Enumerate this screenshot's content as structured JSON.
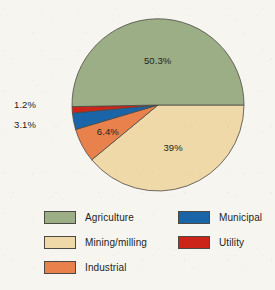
{
  "chart_data": {
    "type": "pie",
    "title": "",
    "legend_position": "bottom",
    "categories": [
      "Agriculture",
      "Mining/milling",
      "Industrial",
      "Municipal",
      "Utility"
    ],
    "values": [
      50.3,
      39,
      6.4,
      3.1,
      1.2
    ],
    "value_labels": [
      "50.3%",
      "39%",
      "6.4%",
      "3.1%",
      "1.2%"
    ],
    "colors": [
      "#9cae85",
      "#efd9a8",
      "#e8814c",
      "#1a65a8",
      "#cc2418"
    ],
    "units": "percent",
    "slices": [
      {
        "name": "Agriculture",
        "value": 50.3,
        "label": "50.3%",
        "color": "#9cae85",
        "label_placement": "inside"
      },
      {
        "name": "Mining/milling",
        "value": 39,
        "label": "39%",
        "color": "#efd9a8",
        "label_placement": "inside"
      },
      {
        "name": "Industrial",
        "value": 6.4,
        "label": "6.4%",
        "color": "#e8814c",
        "label_placement": "inside"
      },
      {
        "name": "Municipal",
        "value": 3.1,
        "label": "3.1%",
        "color": "#1a65a8",
        "label_placement": "outside-left"
      },
      {
        "name": "Utility",
        "value": 1.2,
        "label": "1.2%",
        "color": "#cc2418",
        "label_placement": "outside-left"
      }
    ]
  },
  "legend": {
    "left_column": [
      {
        "label": "Agriculture",
        "color": "#9cae85"
      },
      {
        "label": "Mining/milling",
        "color": "#efd9a8"
      },
      {
        "label": "Industrial",
        "color": "#e8814c"
      }
    ],
    "right_column": [
      {
        "label": "Municipal",
        "color": "#1a65a8"
      },
      {
        "label": "Utility",
        "color": "#cc2418"
      }
    ]
  }
}
